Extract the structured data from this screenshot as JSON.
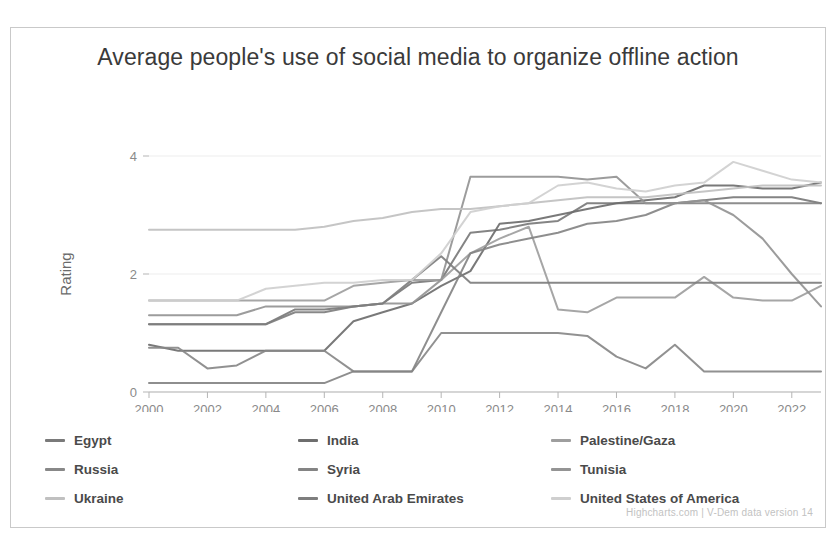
{
  "chart": {
    "title": "Average people's use of social media to organize offline action",
    "credits": "Highcharts.com | V-Dem data version 14"
  },
  "chart_data": {
    "type": "line",
    "title": "Average people's use of social media to organize offline action",
    "xlabel": "",
    "ylabel": "Rating",
    "xlim": [
      2000,
      2023
    ],
    "ylim": [
      0,
      4
    ],
    "grid": true,
    "legend_position": "bottom",
    "xticks": [
      2000,
      2002,
      2004,
      2006,
      2008,
      2010,
      2012,
      2014,
      2016,
      2018,
      2020,
      2022
    ],
    "yticks": [
      0,
      2,
      4
    ],
    "x": [
      2000,
      2001,
      2002,
      2003,
      2004,
      2005,
      2006,
      2007,
      2008,
      2009,
      2010,
      2011,
      2012,
      2013,
      2014,
      2015,
      2016,
      2017,
      2018,
      2019,
      2020,
      2021,
      2022,
      2023
    ],
    "series": [
      {
        "name": "Egypt",
        "color": "#7a7a7a",
        "values": [
          1.15,
          1.15,
          1.15,
          1.15,
          1.15,
          1.4,
          1.4,
          1.45,
          1.5,
          1.85,
          1.9,
          2.7,
          2.75,
          2.85,
          2.9,
          3.2,
          3.2,
          3.2,
          3.2,
          3.25,
          3.3,
          3.3,
          3.3,
          3.2
        ]
      },
      {
        "name": "India",
        "color": "#6e6e6e",
        "values": [
          0.8,
          0.7,
          0.7,
          0.7,
          0.7,
          0.7,
          0.7,
          1.2,
          1.35,
          1.5,
          1.8,
          2.05,
          2.85,
          2.9,
          3.0,
          3.1,
          3.2,
          3.25,
          3.3,
          3.5,
          3.5,
          3.45,
          3.45,
          3.55
        ]
      },
      {
        "name": "Palestine/Gaza",
        "color": "#9e9e9e",
        "values": [
          1.55,
          1.55,
          1.55,
          1.55,
          1.55,
          1.55,
          1.55,
          1.8,
          1.85,
          1.9,
          1.9,
          2.35,
          2.6,
          2.8,
          1.4,
          1.35,
          1.6,
          1.6,
          1.6,
          1.95,
          1.6,
          1.55,
          1.55,
          1.8
        ]
      },
      {
        "name": "Russia",
        "color": "#888888",
        "values": [
          0.75,
          0.75,
          0.4,
          0.45,
          0.7,
          0.7,
          0.7,
          0.35,
          0.35,
          0.35,
          1.0,
          1.0,
          1.0,
          1.0,
          1.0,
          0.95,
          0.6,
          0.4,
          0.8,
          0.35,
          0.35,
          0.35,
          0.35,
          0.35
        ]
      },
      {
        "name": "Syria",
        "color": "#848484",
        "values": [
          0.15,
          0.15,
          0.15,
          0.15,
          0.15,
          0.15,
          0.15,
          0.35,
          0.35,
          0.35,
          1.35,
          2.35,
          2.5,
          2.6,
          2.7,
          2.85,
          2.9,
          3.0,
          3.2,
          3.2,
          3.2,
          3.2,
          3.2,
          3.2
        ]
      },
      {
        "name": "Tunisia",
        "color": "#949494",
        "values": [
          1.3,
          1.3,
          1.3,
          1.3,
          1.45,
          1.45,
          1.45,
          1.45,
          1.5,
          1.5,
          1.9,
          3.65,
          3.65,
          3.65,
          3.65,
          3.6,
          3.65,
          3.2,
          3.2,
          3.25,
          3.0,
          2.6,
          2.0,
          1.45
        ]
      },
      {
        "name": "Ukraine",
        "color": "#c0c0c0",
        "values": [
          2.75,
          2.75,
          2.75,
          2.75,
          2.75,
          2.75,
          2.8,
          2.9,
          2.95,
          3.05,
          3.1,
          3.1,
          3.15,
          3.2,
          3.25,
          3.3,
          3.3,
          3.3,
          3.35,
          3.4,
          3.45,
          3.5,
          3.5,
          3.5
        ]
      },
      {
        "name": "United Arab Emirates",
        "color": "#7e7e7e",
        "values": [
          1.15,
          1.15,
          1.15,
          1.15,
          1.15,
          1.35,
          1.35,
          1.45,
          1.5,
          1.9,
          2.3,
          1.85,
          1.85,
          1.85,
          1.85,
          1.85,
          1.85,
          1.85,
          1.85,
          1.85,
          1.85,
          1.85,
          1.85,
          1.85
        ]
      },
      {
        "name": "United States of America",
        "color": "#cfcfcf",
        "values": [
          1.55,
          1.55,
          1.55,
          1.55,
          1.75,
          1.8,
          1.85,
          1.85,
          1.9,
          1.9,
          2.35,
          3.05,
          3.15,
          3.2,
          3.5,
          3.55,
          3.45,
          3.4,
          3.5,
          3.55,
          3.9,
          3.75,
          3.6,
          3.55
        ]
      }
    ]
  }
}
